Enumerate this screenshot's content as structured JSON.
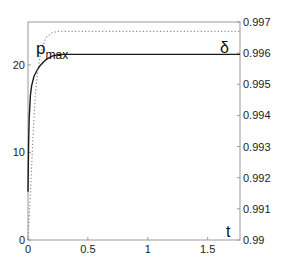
{
  "chart_data": {
    "type": "line",
    "title": "",
    "xlabel": "t",
    "ylabel_left": "p_max",
    "ylabel_right": "δ",
    "xlim": [
      0,
      1.77
    ],
    "ylim_left": [
      0,
      24.9
    ],
    "ylim_right": [
      0.99,
      0.997
    ],
    "x_ticks": [
      "0",
      "0.5",
      "1",
      "1.5"
    ],
    "y_ticks_left": [
      "0",
      "10",
      "20"
    ],
    "y_ticks_right": [
      "0.99",
      "0.991",
      "0.992",
      "0.993",
      "0.994",
      "0.995",
      "0.996",
      "0.997"
    ],
    "grid": false,
    "legend": null,
    "series": [
      {
        "name": "p_max",
        "axis": "left",
        "style": "solid",
        "color": "#1a1a1a",
        "x": [
          0,
          0.005,
          0.01,
          0.02,
          0.03,
          0.05,
          0.08,
          0.1,
          0.15,
          0.2,
          0.25,
          0.3,
          0.4,
          0.5,
          1.0,
          1.5,
          1.77
        ],
        "values": [
          5.5,
          11.0,
          14.0,
          16.5,
          17.6,
          18.7,
          19.5,
          19.9,
          20.6,
          21.0,
          21.15,
          21.2,
          21.2,
          21.2,
          21.2,
          21.2,
          21.2
        ]
      },
      {
        "name": "δ",
        "axis": "right",
        "style": "dotted",
        "color": "#888888",
        "x": [
          0,
          0.02,
          0.04,
          0.06,
          0.08,
          0.1,
          0.12,
          0.15,
          0.2,
          0.25,
          0.3,
          0.35,
          0.4,
          0.5,
          1.0,
          1.5,
          1.77
        ],
        "values": [
          0.99,
          0.9915,
          0.9932,
          0.9946,
          0.9954,
          0.9959,
          0.9962,
          0.9965,
          0.99665,
          0.9967,
          0.9967,
          0.9967,
          0.9967,
          0.9967,
          0.9967,
          0.9967,
          0.9967
        ]
      }
    ],
    "annotations": [
      {
        "text": "p",
        "subscript": "max",
        "near": "top-left"
      },
      {
        "text": "δ",
        "near": "top-right"
      },
      {
        "text": "t",
        "near": "bottom-right"
      }
    ]
  },
  "labels": {
    "pmax_main": "p",
    "pmax_sub": "max",
    "delta": "δ",
    "t": "t"
  }
}
